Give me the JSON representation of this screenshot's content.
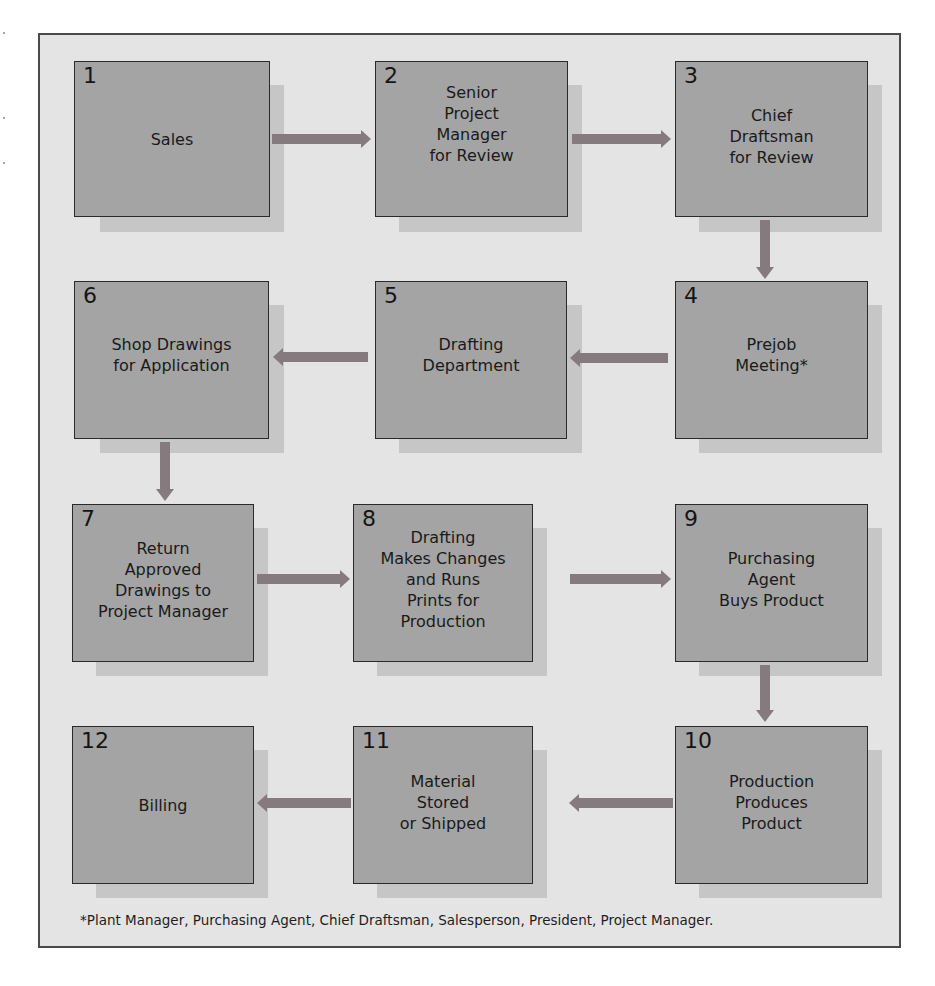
{
  "diagram": {
    "type": "flowchart",
    "direction": "serpentine",
    "colors": {
      "frame_background": "#e4e4e4",
      "frame_border": "#4a4a4a",
      "box_fill": "#a4a4a4",
      "box_border": "#2a2a2a",
      "box_shadow": "#c6c6c6",
      "arrow": "#857a7d"
    },
    "steps": [
      {
        "number": "1",
        "label": "Sales"
      },
      {
        "number": "2",
        "label": "Senior\nProject\nManager\nfor Review"
      },
      {
        "number": "3",
        "label": "Chief\nDraftsman\nfor Review"
      },
      {
        "number": "4",
        "label": "Prejob\nMeeting*"
      },
      {
        "number": "5",
        "label": "Drafting\nDepartment"
      },
      {
        "number": "6",
        "label": "Shop Drawings\nfor Application"
      },
      {
        "number": "7",
        "label": "Return\nApproved\nDrawings to\nProject Manager"
      },
      {
        "number": "8",
        "label": "Drafting\nMakes Changes\nand Runs\nPrints for\nProduction"
      },
      {
        "number": "9",
        "label": "Purchasing\nAgent\nBuys Product"
      },
      {
        "number": "10",
        "label": "Production\nProduces\nProduct"
      },
      {
        "number": "11",
        "label": "Material\nStored\nor Shipped"
      },
      {
        "number": "12",
        "label": "Billing"
      }
    ],
    "edges": [
      {
        "from": "1",
        "to": "2",
        "dir": "right"
      },
      {
        "from": "2",
        "to": "3",
        "dir": "right"
      },
      {
        "from": "3",
        "to": "4",
        "dir": "down"
      },
      {
        "from": "4",
        "to": "5",
        "dir": "left"
      },
      {
        "from": "5",
        "to": "6",
        "dir": "left"
      },
      {
        "from": "6",
        "to": "7",
        "dir": "down"
      },
      {
        "from": "7",
        "to": "8",
        "dir": "right"
      },
      {
        "from": "8",
        "to": "9",
        "dir": "right"
      },
      {
        "from": "9",
        "to": "10",
        "dir": "down"
      },
      {
        "from": "10",
        "to": "11",
        "dir": "left"
      },
      {
        "from": "11",
        "to": "12",
        "dir": "left"
      }
    ],
    "footnote": "*Plant Manager, Purchasing Agent, Chief Draftsman, Salesperson, President, Project Manager."
  }
}
